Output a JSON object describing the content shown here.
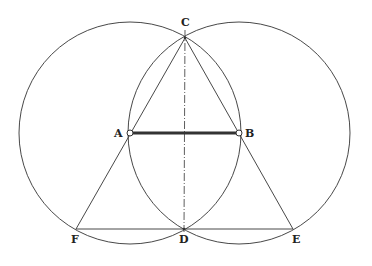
{
  "diagram": {
    "colors": {
      "stroke": "#333333",
      "background": "#ffffff",
      "point_fill": "#ffffff"
    },
    "points": {
      "A": {
        "label": "A",
        "x": 130,
        "y": 133
      },
      "B": {
        "label": "B",
        "x": 239,
        "y": 133
      },
      "C": {
        "label": "C",
        "x": 185,
        "y": 38
      },
      "D": {
        "label": "D",
        "x": 184,
        "y": 229
      },
      "E": {
        "label": "E",
        "x": 293,
        "y": 229
      },
      "F": {
        "label": "F",
        "x": 76,
        "y": 229
      }
    },
    "circles": [
      {
        "name": "circle-center-A",
        "cx": 130,
        "cy": 133,
        "r": 111
      },
      {
        "name": "circle-center-B",
        "cx": 239,
        "cy": 133,
        "r": 111
      }
    ],
    "segments": [
      {
        "name": "segment-AB",
        "from": "A",
        "to": "B",
        "style": "thick"
      },
      {
        "name": "segment-CF",
        "from": "C",
        "to": "F",
        "style": "thin"
      },
      {
        "name": "segment-CE",
        "from": "C",
        "to": "E",
        "style": "thin"
      },
      {
        "name": "segment-FE",
        "from": "F",
        "to": "E",
        "style": "thin"
      },
      {
        "name": "axis-CD",
        "from": "C",
        "to": "D",
        "style": "dash-dot"
      }
    ]
  }
}
